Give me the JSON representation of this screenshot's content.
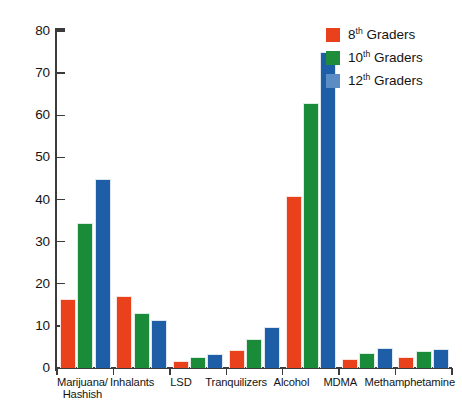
{
  "chart_data": {
    "type": "bar",
    "title": "",
    "subtitle": "",
    "xlabel": "",
    "ylabel": "",
    "ylim": [
      0,
      80
    ],
    "ytick_interval": 10,
    "yticks": [
      0,
      10,
      20,
      30,
      40,
      50,
      60,
      70,
      80
    ],
    "grid": false,
    "legend_position": "top-right",
    "categories": [
      "Marijuana/\nHashish",
      "Inhalants",
      "LSD",
      "Tranquilizers",
      "Alcohol",
      "MDMA",
      "Methamphetamine"
    ],
    "series": [
      {
        "name": "8th Graders",
        "name_prefix": "8",
        "name_sup": "th",
        "name_suffix": " Graders",
        "color": "#E8411C",
        "legend_color": "#E8411C",
        "values": [
          16.5,
          17.0,
          1.6,
          4.2,
          40.8,
          2.2,
          2.5
        ]
      },
      {
        "name": "10th Graders",
        "name_prefix": "10",
        "name_sup": "th",
        "name_suffix": " Graders",
        "color": "#1A8B39",
        "legend_color": "#1F8C3B",
        "values": [
          34.5,
          13.0,
          2.5,
          7.0,
          63.0,
          3.5,
          4.0
        ]
      },
      {
        "name": "12th Graders",
        "name_prefix": "12",
        "name_sup": "th",
        "name_suffix": " Graders",
        "color": "#1D5EA7",
        "legend_color": "#5B8CC4",
        "values": [
          44.8,
          11.3,
          3.3,
          9.8,
          75.0,
          4.7,
          4.6
        ]
      }
    ]
  }
}
